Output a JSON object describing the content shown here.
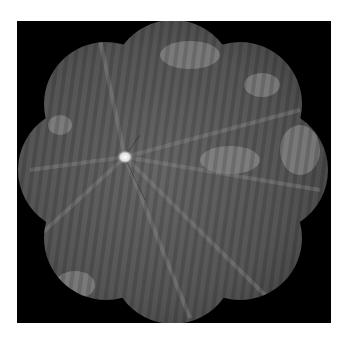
{
  "image": {
    "subject": "wide-field fundus montage",
    "description": "Grayscale retinal montage with petal-shaped outline on black background; bright optic disc left of center with radiating vessels and vertical striping.",
    "colors": {
      "background": "#ffffff",
      "frame": "#000000",
      "retina_base": "#555555",
      "optic_disc": "#f2f2f2"
    }
  }
}
